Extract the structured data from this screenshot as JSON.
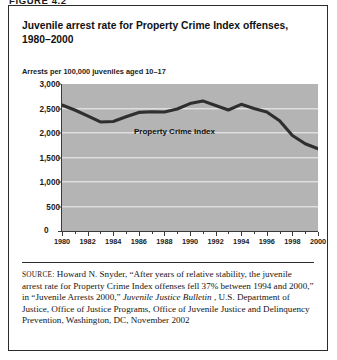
{
  "figure": {
    "label": "FIGURE 4.2",
    "title_line1": "Juvenile arrest rate for Property Crime Index offenses,",
    "title_line2": "1980–2000",
    "axis_caption": "Arrests per 100,000 juveniles aged 10–17"
  },
  "chart_data": {
    "type": "line",
    "title": "Juvenile arrest rate for Property Crime Index offenses, 1980–2000",
    "subtitle": "",
    "xlabel": "",
    "ylabel": "Arrests per 100,000 juveniles aged 10–17",
    "series_label": "Property Crime Index",
    "grid": "horizontal",
    "legend_position": "inline-annotation",
    "xlim": [
      1980,
      2000
    ],
    "ylim": [
      0,
      3000
    ],
    "ytick_labels": [
      "3,000",
      "2,500",
      "2,000",
      "1,500",
      "1,000",
      "500",
      "0"
    ],
    "ytick_values": [
      3000,
      2500,
      2000,
      1500,
      1000,
      500,
      0
    ],
    "xtick_labels": [
      "1980",
      "1982",
      "1984",
      "1986",
      "1988",
      "1990",
      "1992",
      "1994",
      "1996",
      "1998",
      "2000"
    ],
    "xtick_values": [
      1980,
      1982,
      1984,
      1986,
      1988,
      1990,
      1992,
      1994,
      1996,
      1998,
      2000
    ],
    "x": [
      1980,
      1981,
      1982,
      1983,
      1984,
      1985,
      1986,
      1987,
      1988,
      1989,
      1990,
      1991,
      1992,
      1993,
      1994,
      1995,
      1996,
      1997,
      1998,
      1999,
      2000
    ],
    "series": [
      {
        "name": "Property Crime Index",
        "values": [
          2570,
          2470,
          2350,
          2225,
          2235,
          2330,
          2420,
          2435,
          2430,
          2490,
          2600,
          2655,
          2560,
          2470,
          2585,
          2500,
          2430,
          2250,
          1950,
          1780,
          1680
        ],
        "color": "#2f2f2f"
      }
    ],
    "line_color": "#2f2f2f",
    "plot_background": "#b4b4b4",
    "gridline_color": "#f3f3f3",
    "axis_color": "#3a3a3a"
  },
  "source": {
    "keyword": "SOURCE:",
    "text_before_italic": " Howard N. Snyder, “After years of relative stability, the juvenile arrest rate for Property Crime Index offenses fell 37% between 1994 and 2000,” in “Juvenile Arrests 2000,” ",
    "italic_title": "Juvenile Justice Bulletin",
    "text_after_italic": ", U.S. Department of Justice, Office of Justice Programs, Office of Juvenile Justice and Delinquency Prevention, Washington, DC, November 2002"
  }
}
